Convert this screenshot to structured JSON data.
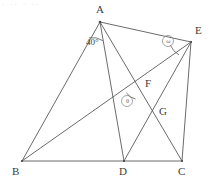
{
  "figure": {
    "kind": "geometry-diagram",
    "width": 213,
    "height": 185,
    "background_color": "#ffffff",
    "stroke_color": "#5a5a5a",
    "label_color": "#3c3c3c",
    "mark_color": "#8f8f8f",
    "artifact_text": "· ·· · ··"
  },
  "points": {
    "A": {
      "label": "A",
      "x": 100,
      "y": 22,
      "label_x": 96,
      "label_y": 4
    },
    "B": {
      "label": "B",
      "x": 22,
      "y": 161,
      "label_x": 12,
      "label_y": 166
    },
    "C": {
      "label": "C",
      "x": 182,
      "y": 161,
      "label_x": 178,
      "label_y": 166
    },
    "D": {
      "label": "D",
      "x": 124,
      "y": 161,
      "label_x": 119,
      "label_y": 166
    },
    "E": {
      "label": "E",
      "x": 191,
      "y": 42,
      "label_x": 195,
      "label_y": 25
    },
    "F": {
      "label": "F",
      "x": 141,
      "y": 85,
      "label_x": 145,
      "label_y": 78
    },
    "G": {
      "label": "G",
      "x": 156,
      "y": 112,
      "label_x": 159,
      "label_y": 106
    }
  },
  "segments": [
    {
      "name": "segment-AB",
      "from": "A",
      "to": "B"
    },
    {
      "name": "segment-AD",
      "from": "A",
      "to": "D"
    },
    {
      "name": "segment-AE",
      "from": "A",
      "to": "E"
    },
    {
      "name": "segment-AC",
      "from": "A",
      "to": "C"
    },
    {
      "name": "segment-BD",
      "from": "B",
      "to": "D"
    },
    {
      "name": "segment-DC",
      "from": "D",
      "to": "C"
    },
    {
      "name": "segment-BE",
      "from": "B",
      "to": "E"
    },
    {
      "name": "segment-ED",
      "from": "E",
      "to": "D"
    },
    {
      "name": "segment-EC",
      "from": "E",
      "to": "C"
    }
  ],
  "angles": {
    "at_A": {
      "label": "40°",
      "value": 40,
      "unit": "degrees",
      "label_x": 86,
      "label_y": 38,
      "arc_cx": 100,
      "arc_cy": 22,
      "arc_r": 19
    },
    "at_E": {
      "label": "ω",
      "marker": "circled-symbol",
      "cx": 168,
      "cy": 41,
      "r": 5.5
    },
    "at_F_interior": {
      "label": "θ",
      "marker": "circled-symbol",
      "cx": 127,
      "cy": 101,
      "r": 5.5
    }
  }
}
